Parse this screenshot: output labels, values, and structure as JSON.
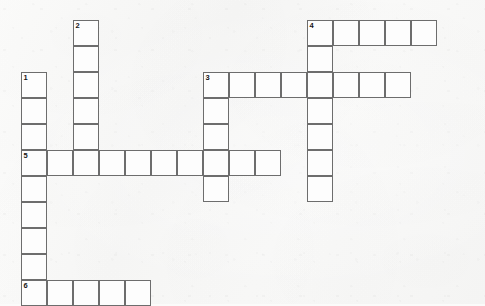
{
  "puzzle": {
    "title": "Crossword Puzzle Grid",
    "type": "crossword",
    "cell_size": 26,
    "grid_origin": {
      "x": 21,
      "y": 20
    },
    "canvas": {
      "width": 485,
      "height": 304
    },
    "colors": {
      "background": "#fbfbfa",
      "cell_fill": "#fdfdfd",
      "cell_border": "#6d6d6d",
      "number_text": "#141414"
    },
    "numbered_clues": [
      {
        "number": "1",
        "row": 2,
        "col": 0,
        "direction": "down",
        "length": 8
      },
      {
        "number": "2",
        "row": 0,
        "col": 2,
        "direction": "down",
        "length": 6
      },
      {
        "number": "3",
        "row": 2,
        "col": 7,
        "direction": "across",
        "length": 8
      },
      {
        "number": "4",
        "row": 0,
        "col": 11,
        "direction": "across",
        "length": 5
      },
      {
        "number": "5",
        "row": 5,
        "col": 0,
        "direction": "across",
        "length": 10
      },
      {
        "number": "6",
        "row": 10,
        "col": 0,
        "direction": "across",
        "length": 5
      }
    ],
    "entries": [
      {
        "number": "1",
        "direction": "down",
        "start_row": 2,
        "start_col": 0,
        "length": 8
      },
      {
        "number": "2",
        "direction": "down",
        "start_row": 0,
        "start_col": 2,
        "length": 6
      },
      {
        "number": "3",
        "direction": "across",
        "start_row": 2,
        "start_col": 7,
        "length": 8
      },
      {
        "number": "3",
        "direction": "down",
        "start_row": 2,
        "start_col": 7,
        "length": 5
      },
      {
        "number": "4",
        "direction": "across",
        "start_row": 0,
        "start_col": 11,
        "length": 5
      },
      {
        "number": "4",
        "direction": "down",
        "start_row": 0,
        "start_col": 11,
        "length": 7
      },
      {
        "number": "5",
        "direction": "across",
        "start_row": 5,
        "start_col": 0,
        "length": 10
      },
      {
        "number": "6",
        "direction": "across",
        "start_row": 10,
        "start_col": 0,
        "length": 5
      }
    ],
    "cells": [
      {
        "row": 0,
        "col": 2,
        "number": "2",
        "letter": ""
      },
      {
        "row": 1,
        "col": 2,
        "number": "",
        "letter": ""
      },
      {
        "row": 2,
        "col": 2,
        "number": "",
        "letter": ""
      },
      {
        "row": 3,
        "col": 2,
        "number": "",
        "letter": ""
      },
      {
        "row": 4,
        "col": 2,
        "number": "",
        "letter": ""
      },
      {
        "row": 0,
        "col": 11,
        "number": "4",
        "letter": ""
      },
      {
        "row": 0,
        "col": 12,
        "number": "",
        "letter": ""
      },
      {
        "row": 0,
        "col": 13,
        "number": "",
        "letter": ""
      },
      {
        "row": 0,
        "col": 14,
        "number": "",
        "letter": ""
      },
      {
        "row": 0,
        "col": 15,
        "number": "",
        "letter": ""
      },
      {
        "row": 1,
        "col": 11,
        "number": "",
        "letter": ""
      },
      {
        "row": 2,
        "col": 0,
        "number": "1",
        "letter": ""
      },
      {
        "row": 3,
        "col": 0,
        "number": "",
        "letter": ""
      },
      {
        "row": 4,
        "col": 0,
        "number": "",
        "letter": ""
      },
      {
        "row": 2,
        "col": 7,
        "number": "3",
        "letter": ""
      },
      {
        "row": 2,
        "col": 8,
        "number": "",
        "letter": ""
      },
      {
        "row": 2,
        "col": 9,
        "number": "",
        "letter": ""
      },
      {
        "row": 2,
        "col": 10,
        "number": "",
        "letter": ""
      },
      {
        "row": 2,
        "col": 11,
        "number": "",
        "letter": ""
      },
      {
        "row": 2,
        "col": 12,
        "number": "",
        "letter": ""
      },
      {
        "row": 2,
        "col": 13,
        "number": "",
        "letter": ""
      },
      {
        "row": 2,
        "col": 14,
        "number": "",
        "letter": ""
      },
      {
        "row": 3,
        "col": 7,
        "number": "",
        "letter": ""
      },
      {
        "row": 3,
        "col": 11,
        "number": "",
        "letter": ""
      },
      {
        "row": 4,
        "col": 7,
        "number": "",
        "letter": ""
      },
      {
        "row": 4,
        "col": 11,
        "number": "",
        "letter": ""
      },
      {
        "row": 5,
        "col": 0,
        "number": "5",
        "letter": ""
      },
      {
        "row": 5,
        "col": 1,
        "number": "",
        "letter": ""
      },
      {
        "row": 5,
        "col": 2,
        "number": "",
        "letter": ""
      },
      {
        "row": 5,
        "col": 3,
        "number": "",
        "letter": ""
      },
      {
        "row": 5,
        "col": 4,
        "number": "",
        "letter": ""
      },
      {
        "row": 5,
        "col": 5,
        "number": "",
        "letter": ""
      },
      {
        "row": 5,
        "col": 6,
        "number": "",
        "letter": ""
      },
      {
        "row": 5,
        "col": 7,
        "number": "",
        "letter": ""
      },
      {
        "row": 5,
        "col": 8,
        "number": "",
        "letter": ""
      },
      {
        "row": 5,
        "col": 9,
        "number": "",
        "letter": ""
      },
      {
        "row": 5,
        "col": 11,
        "number": "",
        "letter": ""
      },
      {
        "row": 6,
        "col": 0,
        "number": "",
        "letter": ""
      },
      {
        "row": 6,
        "col": 7,
        "number": "",
        "letter": ""
      },
      {
        "row": 6,
        "col": 11,
        "number": "",
        "letter": ""
      },
      {
        "row": 7,
        "col": 0,
        "number": "",
        "letter": ""
      },
      {
        "row": 8,
        "col": 0,
        "number": "",
        "letter": ""
      },
      {
        "row": 9,
        "col": 0,
        "number": "",
        "letter": ""
      },
      {
        "row": 10,
        "col": 0,
        "number": "6",
        "letter": ""
      },
      {
        "row": 10,
        "col": 1,
        "number": "",
        "letter": ""
      },
      {
        "row": 10,
        "col": 2,
        "number": "",
        "letter": ""
      },
      {
        "row": 10,
        "col": 3,
        "number": "",
        "letter": ""
      },
      {
        "row": 10,
        "col": 4,
        "number": "",
        "letter": ""
      }
    ]
  }
}
